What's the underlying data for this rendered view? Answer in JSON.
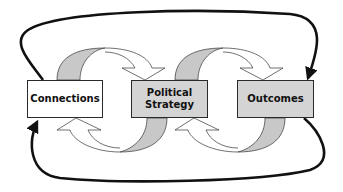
{
  "diagram": {
    "type": "cyclical-flow",
    "nodes": [
      {
        "id": "connections",
        "label": "Connections",
        "fill": "#ffffff"
      },
      {
        "id": "political_strategy",
        "label_line1": "Political",
        "label_line2": "Strategy",
        "fill": "#d4d4d4"
      },
      {
        "id": "outcomes",
        "label": "Outcomes",
        "fill": "#d4d4d4"
      }
    ],
    "edges": [
      {
        "from": "connections",
        "to": "political_strategy",
        "style": "curved-band-arrow"
      },
      {
        "from": "political_strategy",
        "to": "connections",
        "style": "curved-band-arrow"
      },
      {
        "from": "political_strategy",
        "to": "outcomes",
        "style": "curved-band-arrow"
      },
      {
        "from": "outcomes",
        "to": "political_strategy",
        "style": "curved-band-arrow"
      },
      {
        "from": "connections",
        "to": "outcomes",
        "style": "thick-line-arrow",
        "route": "over-top"
      },
      {
        "from": "outcomes",
        "to": "connections",
        "style": "thick-line-arrow",
        "route": "under-bottom"
      }
    ],
    "colors": {
      "band_gray": "#c8c8c8",
      "box_gray": "#d4d4d4",
      "stroke": "#1a1a1a"
    }
  }
}
